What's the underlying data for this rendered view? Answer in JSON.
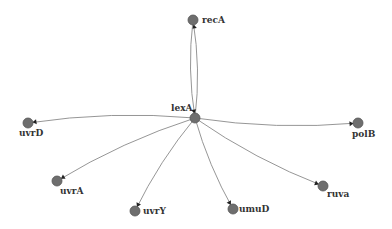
{
  "diagram": {
    "type": "network",
    "hub": "lexA",
    "nodes": [
      {
        "id": "recA",
        "label": "recA",
        "x": 193,
        "y": 20,
        "label_dx": 9,
        "label_dy": -5
      },
      {
        "id": "lexA",
        "label": "lexA",
        "x": 195,
        "y": 118,
        "label_dx": -24,
        "label_dy": -15
      },
      {
        "id": "uvrD",
        "label": "uvrD",
        "x": 28,
        "y": 123,
        "label_dx": -9,
        "label_dy": 5
      },
      {
        "id": "uvrA",
        "label": "uvrA",
        "x": 57,
        "y": 181,
        "label_dx": 3,
        "label_dy": 5
      },
      {
        "id": "uvrY",
        "label": "uvrY",
        "x": 135,
        "y": 211,
        "label_dx": 8,
        "label_dy": -5
      },
      {
        "id": "umuD",
        "label": "umuD",
        "x": 233,
        "y": 209,
        "label_dx": 6,
        "label_dy": -5
      },
      {
        "id": "ruva",
        "label": "ruva",
        "x": 323,
        "y": 186,
        "label_dx": 4,
        "label_dy": 3
      },
      {
        "id": "polB",
        "label": "polB",
        "x": 358,
        "y": 123,
        "label_dx": -6,
        "label_dy": 6
      }
    ],
    "edges": [
      {
        "from": "lexA",
        "to": "recA"
      },
      {
        "from": "recA",
        "to": "lexA"
      },
      {
        "from": "lexA",
        "to": "uvrD"
      },
      {
        "from": "lexA",
        "to": "uvrA"
      },
      {
        "from": "lexA",
        "to": "uvrY"
      },
      {
        "from": "lexA",
        "to": "umuD"
      },
      {
        "from": "lexA",
        "to": "ruva"
      },
      {
        "from": "lexA",
        "to": "polB"
      }
    ]
  }
}
